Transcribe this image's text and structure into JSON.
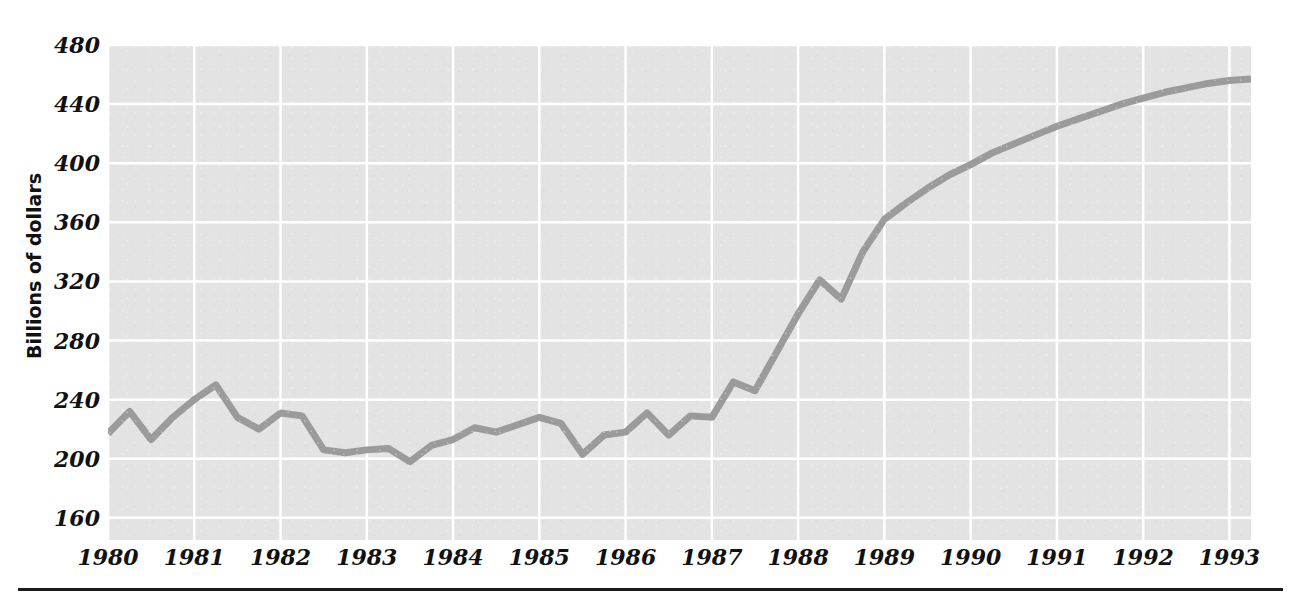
{
  "chart_data": {
    "type": "line",
    "title": "",
    "subtitle": "",
    "xlabel": "",
    "ylabel": "Billions of dollars",
    "xlim": [
      1980.0,
      1993.25
    ],
    "ylim": [
      145,
      480
    ],
    "yticks": [
      480,
      440,
      400,
      360,
      320,
      280,
      240,
      200,
      160
    ],
    "ytick_labels": [
      "480",
      "440",
      "400",
      "360",
      "320",
      "280",
      "240",
      "200",
      "160"
    ],
    "xticks": [
      1980,
      1981,
      1982,
      1983,
      1984,
      1985,
      1986,
      1987,
      1988,
      1989,
      1990,
      1991,
      1992,
      1993
    ],
    "xtick_labels": [
      "1980",
      "1981",
      "1982",
      "1983",
      "1984",
      "1985",
      "1986",
      "1987",
      "1988",
      "1989",
      "1990",
      "1991",
      "1992",
      "1993"
    ],
    "grid": true,
    "grid_color": "#ffffff",
    "plot_background": "#e3e3e3",
    "legend": null,
    "series": [
      {
        "name": "Billions of dollars",
        "color": "#9b9b9b",
        "line_width": 7,
        "x": [
          1980.0,
          1980.25,
          1980.5,
          1980.75,
          1981.0,
          1981.25,
          1981.5,
          1981.75,
          1982.0,
          1982.25,
          1982.5,
          1982.75,
          1983.0,
          1983.25,
          1983.5,
          1983.75,
          1984.0,
          1984.25,
          1984.5,
          1984.75,
          1985.0,
          1985.25,
          1985.5,
          1985.75,
          1986.0,
          1986.25,
          1986.5,
          1986.75,
          1987.0,
          1987.25,
          1987.5,
          1987.75,
          1988.0,
          1988.25,
          1988.5,
          1988.75,
          1989.0,
          1989.25,
          1989.5,
          1989.75,
          1990.0,
          1990.25,
          1990.5,
          1990.75,
          1991.0,
          1991.25,
          1991.5,
          1991.75,
          1992.0,
          1992.25,
          1992.5,
          1992.75,
          1993.0,
          1993.25
        ],
        "y": [
          217,
          232,
          213,
          228,
          240,
          250,
          228,
          220,
          231,
          229,
          206,
          204,
          206,
          207,
          198,
          209,
          213,
          221,
          218,
          223,
          228,
          224,
          203,
          216,
          218,
          231,
          216,
          229,
          228,
          252,
          246,
          272,
          298,
          321,
          308,
          340,
          362,
          373,
          383,
          392,
          399,
          407,
          413,
          419,
          425,
          430,
          435,
          440,
          444,
          448,
          451,
          454,
          456,
          457
        ]
      }
    ]
  },
  "axis": {
    "ylabel": "Billions of dollars"
  }
}
